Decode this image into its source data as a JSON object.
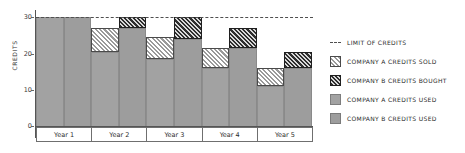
{
  "chart_data": {
    "type": "bar",
    "title": "",
    "xlabel": "",
    "ylabel": "CREDITS",
    "ylim": [
      0,
      32
    ],
    "yticks": [
      0,
      10,
      20,
      30
    ],
    "ytick_labels": [
      "0",
      "10",
      "20",
      "30"
    ],
    "grid": false,
    "legend_position": "right",
    "categories": [
      "Year 1",
      "Year 2",
      "Year 3",
      "Year 4",
      "Year 5"
    ],
    "limit_of_credits": 30,
    "series": [
      {
        "name": "COMPANY A CREDITS USED",
        "key": "used_a",
        "color": "#a2a2a2",
        "pattern": "solid",
        "values": [
          30,
          20.5,
          18.5,
          16,
          11
        ]
      },
      {
        "name": "COMPANY A CREDITS SOLD",
        "key": "sold_a",
        "color": "#ffffff",
        "pattern": "light-hatch",
        "values": [
          0,
          6.5,
          6,
          5.5,
          5
        ]
      },
      {
        "name": "COMPANY B CREDITS USED",
        "key": "used_b",
        "color": "#9d9d9d",
        "pattern": "solid",
        "values": [
          30,
          27,
          24,
          21.5,
          16
        ]
      },
      {
        "name": "COMPANY B CREDITS BOUGHT",
        "key": "bought_b",
        "color": "#2e2e2e",
        "pattern": "dark-hatch",
        "values": [
          0,
          3,
          6,
          5.5,
          4.5
        ]
      }
    ],
    "group_totals": {
      "company_a": [
        30,
        27,
        24.5,
        21.5,
        16
      ],
      "company_b": [
        30,
        30,
        30,
        27,
        20.5
      ]
    }
  },
  "axis": {
    "y_title": "CREDITS",
    "y_ticks": [
      "30",
      "20",
      "10",
      "0"
    ]
  },
  "legend": {
    "items": [
      {
        "label": "LIMIT OF CREDITS",
        "swatch": "limit-line-swatch"
      },
      {
        "label": "COMPANY A CREDITS SOLD",
        "swatch": "light-hatch-swatch"
      },
      {
        "label": "COMPANY B CREDITS BOUGHT",
        "swatch": "dark-hatch-swatch"
      },
      {
        "label": "COMPANY A CREDITS USED",
        "swatch": "gray-swatch"
      },
      {
        "label": "COMPANY B CREDITS USED",
        "swatch": "light-gray-swatch"
      }
    ]
  },
  "x_labels": [
    "Year 1",
    "Year 2",
    "Year 3",
    "Year 4",
    "Year 5"
  ]
}
